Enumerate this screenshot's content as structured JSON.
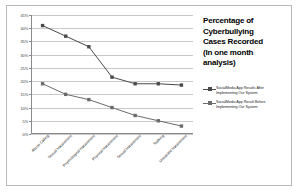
{
  "chart_data": {
    "type": "line",
    "title_lines": [
      "Percentage of",
      "Cyberbullying",
      "Cases Recorded",
      "(In one month",
      "analysis)"
    ],
    "xlabel": "",
    "ylabel": "",
    "ylim": [
      0,
      45
    ],
    "ytick_labels": [
      "45%",
      "40%",
      "35%",
      "30%",
      "25%",
      "20%",
      "15%",
      "10%",
      "5%",
      "0%"
    ],
    "ytick_values": [
      45,
      40,
      35,
      30,
      25,
      20,
      15,
      10,
      5,
      0
    ],
    "grid": true,
    "legend_position": "right",
    "categories": [
      "Abuse Calling",
      "Sexual Harassment",
      "Psychological Harassment",
      "Physical Harassment",
      "Sexual Harassment",
      "Stalking",
      "Unwanted Harassment"
    ],
    "series": [
      {
        "name": "SocialMedia App Results After Implementing Our System",
        "name_lines": [
          "SocialMedia App Results After",
          "Implementing Our System"
        ],
        "values": [
          41,
          37,
          33,
          21.5,
          19,
          19,
          18.5
        ],
        "color": "#4a4a4a"
      },
      {
        "name": "SocialMedia App Result Before Implementing Our System",
        "name_lines": [
          "SocialMedia App Result Before",
          "Implementing Our System"
        ],
        "values": [
          19,
          15,
          13,
          10,
          7,
          5,
          3
        ],
        "color": "#6b6b6b"
      }
    ]
  },
  "colors": {
    "frame_border": "#b9b9b9",
    "gridline": "#c9c9c9",
    "axis": "#8a8a8a",
    "text": "#1c1c1c"
  }
}
